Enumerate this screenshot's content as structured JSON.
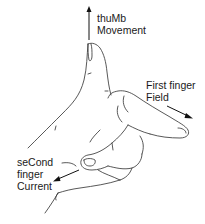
{
  "diagram": {
    "labels": {
      "thumb": {
        "line1": "thuMb",
        "line2": "Movement"
      },
      "first_finger": {
        "line1": "First finger",
        "line2": "Field"
      },
      "second_finger": {
        "line1": "seCond",
        "line2": "finger",
        "line3": "Current"
      }
    },
    "arrows": [
      {
        "name": "thumb-arrow",
        "direction": "up"
      },
      {
        "name": "first-finger-arrow",
        "direction": "down-right"
      },
      {
        "name": "second-finger-arrow",
        "direction": "down-left"
      }
    ],
    "colors": {
      "line": "#3a3a3a",
      "text": "#1a1a1a",
      "background": "#ffffff"
    }
  }
}
